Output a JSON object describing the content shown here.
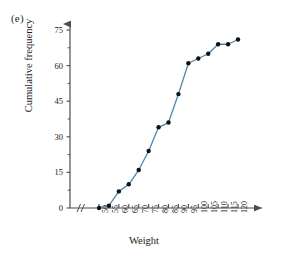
{
  "panel": {
    "label": "(e)"
  },
  "chart_data": {
    "type": "line",
    "title": "",
    "subtitle": "",
    "xlabel": "Weight",
    "ylabel": "Cumulative frequency",
    "x": [
      50,
      55,
      60,
      65,
      70,
      75,
      80,
      85,
      90,
      95,
      100,
      105,
      110,
      115,
      120
    ],
    "values": [
      0,
      1,
      7,
      10,
      16,
      24,
      34,
      36,
      48,
      61,
      63,
      65,
      69,
      69,
      71
    ],
    "series": [
      {
        "name": "Cumulative frequency",
        "values": [
          0,
          1,
          7,
          10,
          16,
          24,
          34,
          36,
          48,
          61,
          63,
          65,
          69,
          69,
          71
        ]
      }
    ],
    "xticks": [
      "50",
      "55",
      "60",
      "65",
      "70",
      "75",
      "80",
      "85",
      "90",
      "95",
      "100",
      "105",
      "110",
      "115",
      "120"
    ],
    "yticks": [
      "0",
      "15",
      "30",
      "45",
      "60",
      "75"
    ],
    "ytick_values": [
      0,
      15,
      30,
      45,
      60,
      75
    ],
    "yminor_values": [
      7.5,
      22.5,
      37.5,
      52.5,
      67.5
    ],
    "xlim": [
      50,
      120
    ],
    "ylim": [
      0,
      78
    ],
    "grid": false,
    "legend": false,
    "axis_break": "//",
    "line_color": "#4a88b0",
    "marker_color": "#111111",
    "axis_color": "#4d4d4d"
  }
}
